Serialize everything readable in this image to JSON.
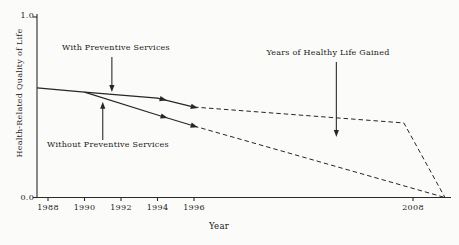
{
  "chart_data": {
    "type": "line",
    "title": "",
    "xlabel": "Year",
    "ylabel": "Health-Related Quality of Life",
    "x_range": [
      1987.4,
      2010.1
    ],
    "y_range": [
      0.0,
      1.0
    ],
    "grid": false,
    "legend_position": "none (inline annotated labels with arrows)",
    "line_color": "#262626",
    "background_color": "#fbfbf9",
    "x_ticks": [
      {
        "year": 1988,
        "label": "1988"
      },
      {
        "year": 1990,
        "label": "1990"
      },
      {
        "year": 1992,
        "label": "1992"
      },
      {
        "year": 1994,
        "label": "1994"
      },
      {
        "year": 1996,
        "label": "1996"
      },
      {
        "year": 2008,
        "label": "2008"
      }
    ],
    "y_ticks": [
      {
        "value": 1.0,
        "label": "1.0"
      },
      {
        "value": 0.0,
        "label": "0.0"
      }
    ],
    "series": [
      {
        "name": "With Preventive Services",
        "solid": [
          [
            1987.4,
            0.607
          ],
          [
            1990,
            0.584
          ],
          [
            1994,
            0.551
          ],
          [
            1996,
            0.501
          ]
        ],
        "projected": [
          [
            1996,
            0.501
          ],
          [
            2007.5,
            0.413
          ],
          [
            2009.75,
            0.0
          ]
        ],
        "marker_years": [
          1994.3,
          1996
        ]
      },
      {
        "name": "Without Preventive Services",
        "solid": [
          [
            1990,
            0.584
          ],
          [
            1994,
            0.457
          ],
          [
            1996,
            0.396
          ]
        ],
        "projected": [
          [
            1996,
            0.396
          ],
          [
            2009.75,
            0.0
          ]
        ],
        "marker_years": [
          1994.35,
          1996
        ]
      }
    ],
    "annotations": [
      {
        "id": "with",
        "label": "With Preventive Services",
        "arrow": {
          "year": 1991.5,
          "from": 0.778,
          "to": 0.584,
          "direction": "down"
        }
      },
      {
        "id": "without",
        "label": "Without Preventive Services",
        "arrow": {
          "year": 1991.0,
          "from": 0.319,
          "to": 0.53,
          "direction": "up"
        }
      },
      {
        "id": "gained",
        "label": "Years of Healthy Life Gained",
        "arrow": {
          "year": 2003.8,
          "from": 0.751,
          "to": 0.335,
          "direction": "down"
        }
      }
    ]
  }
}
